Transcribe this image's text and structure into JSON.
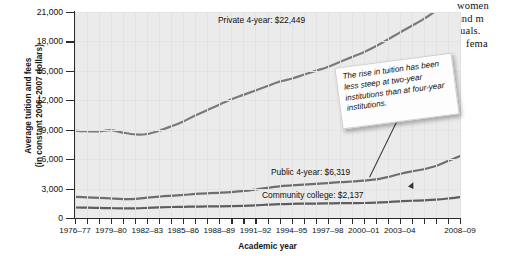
{
  "chart_data": {
    "type": "line",
    "title": "",
    "xlabel": "Academic year",
    "ylabel_line1": "Average tuition and fees",
    "ylabel_line2": "(in constant 2006–2007 dollars)",
    "ylim": [
      0,
      21000
    ],
    "yticks": [
      0,
      3000,
      6000,
      9000,
      12000,
      15000,
      18000,
      21000
    ],
    "ytick_labels": [
      "0",
      "3,000",
      "6,000",
      "9,000",
      "12,000",
      "15,000",
      "18,000",
      "21,000"
    ],
    "grid": true,
    "legend_position": "inline-labels",
    "xtick_labels": [
      "1976–77",
      "1979–80",
      "1982–83",
      "1985–86",
      "1988–89",
      "1991–92",
      "1994–95",
      "1997–98",
      "2000–01",
      "2003–04",
      "2008–09"
    ],
    "x": [
      "1976-77",
      "1977-78",
      "1978-79",
      "1979-80",
      "1980-81",
      "1981-82",
      "1982-83",
      "1983-84",
      "1984-85",
      "1985-86",
      "1986-87",
      "1987-88",
      "1988-89",
      "1989-90",
      "1990-91",
      "1991-92",
      "1992-93",
      "1993-94",
      "1994-95",
      "1995-96",
      "1996-97",
      "1997-98",
      "1998-99",
      "1999-00",
      "2000-01",
      "2001-02",
      "2002-03",
      "2003-04",
      "2004-05",
      "2005-06",
      "2006-07",
      "2007-08",
      "2008-09"
    ],
    "series": [
      {
        "name": "Private 4-year",
        "label": "Private 4-year: $22,449",
        "end_value": 22449,
        "color": "#7a7a7a",
        "values": [
          8900,
          8850,
          8830,
          8950,
          8700,
          8520,
          8560,
          8900,
          9350,
          9850,
          10450,
          11000,
          11550,
          12100,
          12550,
          13000,
          13450,
          13900,
          14200,
          14600,
          15000,
          15400,
          15900,
          16400,
          16900,
          17500,
          18200,
          18900,
          19600,
          20300,
          21100,
          21800,
          22449
        ]
      },
      {
        "name": "Public 4-year",
        "label": "Public 4-year: $6,319",
        "end_value": 6319,
        "color": "#6e6e6e",
        "values": [
          2150,
          2110,
          2060,
          1990,
          1930,
          1950,
          2070,
          2180,
          2280,
          2350,
          2450,
          2520,
          2570,
          2640,
          2760,
          2900,
          3080,
          3230,
          3320,
          3400,
          3480,
          3560,
          3650,
          3720,
          3800,
          3930,
          4180,
          4490,
          4750,
          4970,
          5300,
          5800,
          6319
        ]
      },
      {
        "name": "Community college",
        "label": "Community college: $2,137",
        "end_value": 2137,
        "color": "#5e5e5e",
        "values": [
          1070,
          1060,
          1030,
          1000,
          980,
          990,
          1030,
          1080,
          1120,
          1140,
          1160,
          1180,
          1190,
          1210,
          1240,
          1290,
          1360,
          1420,
          1450,
          1460,
          1470,
          1490,
          1510,
          1520,
          1530,
          1560,
          1620,
          1700,
          1760,
          1800,
          1870,
          1990,
          2137
        ]
      }
    ],
    "annotation": {
      "text": "The rise in tuition has been less steep at two-year institutions than at four-year institutions."
    }
  },
  "page_bleed": {
    "line1": "women",
    "line2": "and m",
    "line3": "tuals.",
    "line4": "fema"
  }
}
